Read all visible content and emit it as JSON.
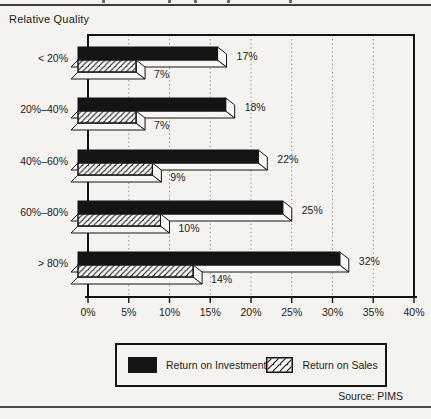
{
  "page": {
    "axis_title": "Relative Quality",
    "source": "Source: PIMS"
  },
  "chart_data": {
    "type": "bar",
    "orientation": "horizontal",
    "title": "",
    "xlabel": "",
    "ylabel": "Relative Quality",
    "categories": [
      "< 20%",
      "20%–40%",
      "40%–60%",
      "60%–80%",
      "> 80%"
    ],
    "series": [
      {
        "name": "Return on Investment",
        "style": "solid-black",
        "values": [
          17,
          18,
          22,
          25,
          32
        ],
        "labels": [
          "17%",
          "18%",
          "22%",
          "25%",
          "32%"
        ]
      },
      {
        "name": "Return on Sales",
        "style": "diagonal-hatch",
        "values": [
          7,
          7,
          9,
          10,
          14
        ],
        "labels": [
          "7%",
          "7%",
          "9%",
          "10%",
          "14%"
        ]
      }
    ],
    "xlim": [
      0,
      40
    ],
    "x_tick_step": 5,
    "x_ticks": [
      "0%",
      "5%",
      "10%",
      "15%",
      "20%",
      "25%",
      "30%",
      "35%",
      "40%"
    ],
    "grid": "vertical-dotted",
    "legend_position": "bottom",
    "source": "Source: PIMS"
  },
  "colors": {
    "bar_black": "#141414",
    "outline": "#141414",
    "paper": "#f4f3ef",
    "grid_dot": "#8c8c8c",
    "rule": "#3d3d3d",
    "text": "#1b1b1b"
  }
}
